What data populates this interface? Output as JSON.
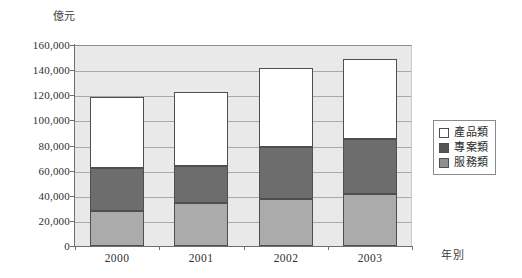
{
  "chart_data": {
    "type": "bar",
    "subtype": "stacked-vertical",
    "title": "",
    "xlabel": "年別",
    "ylabel": "億元",
    "categories": [
      "2000",
      "2001",
      "2002",
      "2003"
    ],
    "series": [
      {
        "name": "服務類",
        "values": [
          28000,
          34000,
          37500,
          41500
        ],
        "color": "#ababab"
      },
      {
        "name": "專案類",
        "values": [
          34000,
          30000,
          41500,
          43500
        ],
        "color": "#6d6d6d"
      },
      {
        "name": "產品類",
        "values": [
          57000,
          59000,
          63000,
          64000
        ],
        "color": "#ffffff"
      }
    ],
    "stack_totals": [
      119000,
      123000,
      142000,
      149000
    ],
    "ylim": [
      0,
      160000
    ],
    "ytick_step": 20000,
    "ytick_labels": [
      "160,000",
      "140,000",
      "120,000",
      "100,000",
      "80,000",
      "60,000",
      "40,000",
      "20,000",
      "0"
    ],
    "ytick_values": [
      160000,
      140000,
      120000,
      100000,
      80000,
      60000,
      40000,
      20000,
      0
    ],
    "grid": true,
    "legend_position": "right",
    "plot_background": "#e9e9e9",
    "axis_color": "#6e6e6e",
    "gridline_color": "#a9a9a9"
  },
  "axes": {
    "unit_label": "億元",
    "x_axis_title": "年別"
  },
  "legend": {
    "entries": [
      {
        "label": "產品類",
        "swatch": "white-square-icon"
      },
      {
        "label": "專案類",
        "swatch": "dark-gray-square-icon"
      },
      {
        "label": "服務類",
        "swatch": "medium-gray-square-icon"
      }
    ]
  }
}
